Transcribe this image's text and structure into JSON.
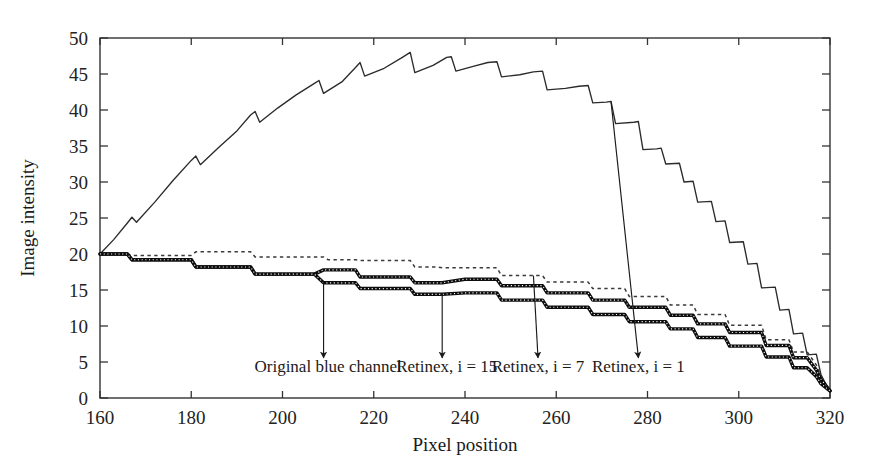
{
  "chart_data": {
    "type": "line",
    "title": "",
    "subtitle": "",
    "xlabel": "Pixel position",
    "ylabel": "Image intensity",
    "xlim": [
      160,
      320
    ],
    "ylim": [
      0,
      50
    ],
    "xticks": [
      160,
      180,
      200,
      220,
      240,
      260,
      280,
      300,
      320
    ],
    "xtick_labels": [
      "160",
      "180",
      "200",
      "220",
      "240",
      "260",
      "280",
      "300",
      "320"
    ],
    "yticks": [
      0,
      5,
      10,
      15,
      20,
      25,
      30,
      35,
      40,
      45,
      50
    ],
    "ytick_labels": [
      "0",
      "5",
      "10",
      "15",
      "20",
      "25",
      "30",
      "35",
      "40",
      "45",
      "50"
    ],
    "grid": false,
    "legend_position": "none",
    "frame": "box",
    "series": [
      {
        "name": "Retinex, i = 1",
        "style": "solid-thin",
        "color": "#2b2b2b",
        "x": [
          160,
          163,
          166,
          167,
          168,
          172,
          176,
          180,
          181,
          182,
          186,
          190,
          193,
          194,
          195,
          199,
          203,
          207,
          208,
          209,
          213,
          216,
          217,
          218,
          222,
          226,
          228,
          229,
          233,
          236,
          237,
          238,
          242,
          245,
          247,
          248,
          252,
          255,
          257,
          258,
          262,
          265,
          267,
          268,
          271,
          272,
          273,
          277,
          278,
          279,
          282,
          283,
          284,
          287,
          288,
          290,
          291,
          294,
          295,
          297,
          298,
          301,
          302,
          304,
          305,
          308,
          309,
          311,
          312,
          314,
          315,
          317,
          318,
          319,
          320
        ],
        "y": [
          20.0,
          22.0,
          24.3,
          25.1,
          24.4,
          27.2,
          30.2,
          33.0,
          33.6,
          32.4,
          34.8,
          37.1,
          39.3,
          39.8,
          38.3,
          40.3,
          42.1,
          43.7,
          44.1,
          42.3,
          43.9,
          45.9,
          46.6,
          44.7,
          45.7,
          47.2,
          48.0,
          45.2,
          46.2,
          47.3,
          47.4,
          45.4,
          46.1,
          46.6,
          46.7,
          44.6,
          44.9,
          45.3,
          45.4,
          42.8,
          43.0,
          43.3,
          43.4,
          41.0,
          41.1,
          41.2,
          38.1,
          38.3,
          38.4,
          34.5,
          34.6,
          34.7,
          32.5,
          32.6,
          30.0,
          30.1,
          27.2,
          27.3,
          24.5,
          24.6,
          21.6,
          21.7,
          18.6,
          18.7,
          15.3,
          15.4,
          12.2,
          12.3,
          8.9,
          9.0,
          6.0,
          6.1,
          3.3,
          2.0,
          1.0
        ]
      },
      {
        "name": "Retinex, i = 7",
        "style": "dotted-thin",
        "color": "#3a3a3a",
        "x": [
          160,
          166,
          167,
          172,
          180,
          181,
          186,
          193,
          194,
          199,
          205,
          209,
          210,
          216,
          217,
          222,
          228,
          229,
          234,
          235,
          240,
          247,
          248,
          252,
          257,
          258,
          263,
          267,
          268,
          272,
          275,
          276,
          281,
          284,
          285,
          290,
          291,
          295,
          297,
          298,
          302,
          305,
          306,
          309,
          311,
          312,
          315,
          317,
          318,
          320
        ],
        "y": [
          20.0,
          20.0,
          19.8,
          19.8,
          19.8,
          20.3,
          20.3,
          20.3,
          19.6,
          19.6,
          19.6,
          19.6,
          19.2,
          19.2,
          19.1,
          19.1,
          19.1,
          18.2,
          18.2,
          18.1,
          18.1,
          18.1,
          17.0,
          17.0,
          17.0,
          16.1,
          16.1,
          16.1,
          15.2,
          15.2,
          15.2,
          14.1,
          14.1,
          14.1,
          12.9,
          12.9,
          11.6,
          11.6,
          11.6,
          10.1,
          10.1,
          10.1,
          8.1,
          8.1,
          8.1,
          6.4,
          6.4,
          4.6,
          3.0,
          1.0
        ]
      },
      {
        "name": "Original blue channel",
        "style": "marker-thick",
        "color": "#0d0d0d",
        "x": [
          160,
          166,
          167,
          172,
          176,
          180,
          181,
          186,
          190,
          193,
          194,
          199,
          203,
          207,
          209,
          210,
          214,
          216,
          217,
          222,
          226,
          228,
          229,
          233,
          235,
          240,
          244,
          247,
          248,
          252,
          256,
          257,
          258,
          263,
          266,
          267,
          268,
          272,
          275,
          276,
          281,
          284,
          285,
          289,
          290,
          291,
          295,
          297,
          298,
          302,
          305,
          306,
          309,
          311,
          312,
          315,
          317,
          318,
          320
        ],
        "y": [
          20.0,
          20.0,
          19.2,
          19.2,
          19.2,
          19.2,
          18.2,
          18.2,
          18.2,
          18.2,
          17.2,
          17.2,
          17.2,
          17.2,
          17.8,
          17.8,
          17.8,
          17.8,
          16.8,
          16.8,
          16.8,
          16.8,
          16.0,
          16.0,
          16.0,
          16.5,
          16.5,
          16.5,
          15.6,
          15.6,
          15.6,
          15.6,
          14.6,
          14.6,
          14.6,
          14.6,
          13.6,
          13.6,
          13.6,
          12.6,
          12.6,
          12.6,
          11.5,
          11.5,
          11.5,
          10.3,
          10.3,
          10.3,
          9.1,
          9.1,
          9.1,
          7.3,
          7.3,
          7.3,
          5.6,
          5.6,
          3.9,
          2.6,
          1.0
        ]
      },
      {
        "name": "Retinex, i = 15",
        "style": "marker-thick",
        "color": "#0d0d0d",
        "x": [
          160,
          166,
          167,
          172,
          176,
          180,
          181,
          186,
          190,
          193,
          194,
          199,
          203,
          207,
          209,
          210,
          214,
          216,
          217,
          222,
          226,
          228,
          229,
          233,
          235,
          240,
          244,
          247,
          248,
          252,
          256,
          257,
          258,
          263,
          266,
          267,
          268,
          272,
          275,
          276,
          281,
          284,
          285,
          289,
          290,
          291,
          295,
          297,
          298,
          302,
          305,
          306,
          309,
          311,
          312,
          315,
          317,
          318,
          320
        ],
        "y": [
          20.0,
          20.0,
          19.2,
          19.2,
          19.2,
          19.2,
          18.2,
          18.2,
          18.2,
          18.2,
          17.2,
          17.2,
          17.2,
          17.2,
          16.0,
          16.0,
          16.0,
          16.0,
          15.2,
          15.2,
          15.2,
          15.2,
          14.4,
          14.4,
          14.4,
          14.6,
          14.6,
          14.6,
          13.6,
          13.6,
          13.6,
          13.6,
          12.6,
          12.6,
          12.6,
          12.6,
          11.6,
          11.6,
          11.6,
          10.6,
          10.6,
          10.6,
          9.6,
          9.6,
          9.6,
          8.4,
          8.4,
          8.4,
          7.2,
          7.2,
          7.2,
          5.7,
          5.7,
          5.7,
          4.2,
          4.2,
          3.0,
          2.0,
          1.0
        ]
      }
    ],
    "annotations": [
      {
        "label": "Original blue channel",
        "text_x": 210,
        "text_y": 3.6,
        "arrow_from_x": 209,
        "arrow_from_y": 16.2,
        "arrow_to_x": 209,
        "arrow_to_y": 5.6
      },
      {
        "label": "Retinex, i = 15",
        "text_x": 236,
        "text_y": 3.6,
        "arrow_from_x": 235,
        "arrow_from_y": 14.6,
        "arrow_to_x": 235,
        "arrow_to_y": 5.6
      },
      {
        "label": "Retinex, i = 7",
        "text_x": 256,
        "text_y": 3.6,
        "arrow_from_x": 255,
        "arrow_from_y": 17.0,
        "arrow_to_x": 256,
        "arrow_to_y": 5.6
      },
      {
        "label": "Retinex, i = 1",
        "text_x": 278,
        "text_y": 3.6,
        "arrow_from_x": 272,
        "arrow_from_y": 41.2,
        "arrow_to_x": 278,
        "arrow_to_y": 5.6
      }
    ]
  },
  "figure": {
    "background_color": "#ffffff",
    "axis_color": "#333333",
    "text_color": "#1a1a1a"
  }
}
